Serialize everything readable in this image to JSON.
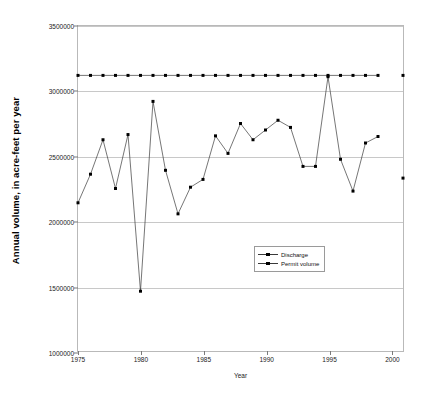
{
  "chart_data": {
    "type": "line",
    "title": "",
    "xlabel": "Year",
    "ylabel": "Annual volume, in acre-feet per year",
    "xlim": [
      1975,
      2001
    ],
    "ylim": [
      1000000,
      3500000
    ],
    "ytick_step": 500000,
    "grid": true,
    "legend_position": "center-right",
    "xticks": [
      1975,
      1980,
      1985,
      1990,
      1995,
      2000
    ],
    "xtick_labels": [
      "1975",
      "1980",
      "1985",
      "1990",
      "1995",
      "2000"
    ],
    "yticks": [
      1000000,
      1500000,
      2000000,
      2500000,
      3000000,
      3500000
    ],
    "ytick_labels": [
      "1000000",
      "1500000",
      "2000000",
      "2500000",
      "3000000",
      "3500000"
    ],
    "series": [
      {
        "name": "Discharge",
        "marker": "square",
        "x": [
          1975,
          1976,
          1977,
          1978,
          1979,
          1980,
          1981,
          1982,
          1983,
          1984,
          1985,
          1986,
          1987,
          1988,
          1989,
          1990,
          1991,
          1992,
          1993,
          1994,
          1995,
          1996,
          1997,
          1998,
          1999
        ],
        "values": [
          2140000,
          2360000,
          2625000,
          2250000,
          2665000,
          1460000,
          2920000,
          2390000,
          2055000,
          2260000,
          2320000,
          2655000,
          2520000,
          2750000,
          2625000,
          2700000,
          2775000,
          2720000,
          2420000,
          2420000,
          3110000,
          2475000,
          2230000,
          2600000,
          2650000
        ]
      },
      {
        "name": "Discharge (2001)",
        "marker": "square",
        "x": [
          2001
        ],
        "values": [
          2330000
        ]
      },
      {
        "name": "Permit volume",
        "marker": "square",
        "x": [
          1975,
          1976,
          1977,
          1978,
          1979,
          1980,
          1981,
          1982,
          1983,
          1984,
          1985,
          1986,
          1987,
          1988,
          1989,
          1990,
          1991,
          1992,
          1993,
          1994,
          1995,
          1996,
          1997,
          1998,
          1999
        ],
        "values": [
          3120000,
          3120000,
          3120000,
          3120000,
          3120000,
          3120000,
          3120000,
          3120000,
          3120000,
          3120000,
          3120000,
          3120000,
          3120000,
          3120000,
          3120000,
          3120000,
          3120000,
          3120000,
          3120000,
          3120000,
          3120000,
          3120000,
          3120000,
          3120000,
          3120000
        ]
      },
      {
        "name": "Permit volume (2001)",
        "marker": "square",
        "x": [
          2001
        ],
        "values": [
          3120000
        ]
      }
    ],
    "legend_entries": [
      "Discharge",
      "Permit volume"
    ],
    "colors": {
      "line": "#3a3a3a",
      "marker": "#000000",
      "grid": "#c8c8c8",
      "axis": "#b9b9b9",
      "background": "#ffffff"
    }
  }
}
